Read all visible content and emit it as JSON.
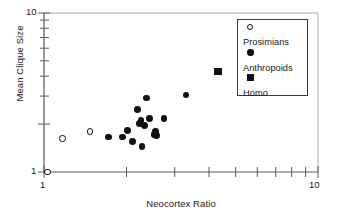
{
  "chart_data": {
    "type": "scatter",
    "title": "",
    "xlabel": "Neocortex Ratio",
    "ylabel": "Mean Clique Size",
    "xscale": "log",
    "yscale": "log",
    "xlim": [
      1,
      10
    ],
    "ylim": [
      1,
      10
    ],
    "xticks": [
      1,
      10
    ],
    "xticklabels": [
      "1",
      "10"
    ],
    "yticks": [
      1,
      10
    ],
    "yticklabels": [
      "1",
      "10"
    ],
    "grid": false,
    "legend_position": "top-right",
    "series": [
      {
        "name": "Prosimians",
        "marker": "open-circle",
        "color": "#111111",
        "points": [
          {
            "x": 1.03,
            "y": 1.0
          },
          {
            "x": 1.17,
            "y": 1.62
          },
          {
            "x": 1.47,
            "y": 1.8
          }
        ]
      },
      {
        "name": "Anthropoids",
        "marker": "filled-circle",
        "color": "#111111",
        "points": [
          {
            "x": 1.72,
            "y": 1.66
          },
          {
            "x": 1.93,
            "y": 1.66
          },
          {
            "x": 2.02,
            "y": 1.83
          },
          {
            "x": 2.1,
            "y": 1.56
          },
          {
            "x": 2.2,
            "y": 2.47
          },
          {
            "x": 2.23,
            "y": 2.02
          },
          {
            "x": 2.26,
            "y": 2.1
          },
          {
            "x": 2.28,
            "y": 1.45
          },
          {
            "x": 2.33,
            "y": 1.95
          },
          {
            "x": 2.36,
            "y": 2.92
          },
          {
            "x": 2.42,
            "y": 2.18
          },
          {
            "x": 2.52,
            "y": 1.73
          },
          {
            "x": 2.56,
            "y": 1.8
          },
          {
            "x": 2.58,
            "y": 1.7
          },
          {
            "x": 2.74,
            "y": 2.17
          },
          {
            "x": 3.3,
            "y": 3.05
          }
        ]
      },
      {
        "name": "Homo",
        "marker": "filled-square",
        "color": "#111111",
        "points": [
          {
            "x": 4.32,
            "y": 4.28
          }
        ]
      }
    ]
  },
  "axes": {
    "y_top_label": "10",
    "y_bottom_label": "1",
    "x_left_label": "1",
    "x_right_label": "10",
    "ylabel": "Mean Clique Size",
    "xlabel": "Neocortex Ratio"
  },
  "legend": {
    "entries": [
      {
        "label": "Prosimians",
        "marker": "open-circle"
      },
      {
        "label": "Anthropoids",
        "marker": "filled-circle"
      },
      {
        "label": "Homo",
        "marker": "filled-square"
      }
    ]
  },
  "colors": {
    "marker": "#111111",
    "axis": "#555555",
    "frame": "#999999",
    "text": "#1a1a1a",
    "background": "#ffffff"
  }
}
